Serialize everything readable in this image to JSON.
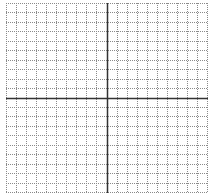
{
  "diagram": {
    "type": "coordinate-grid",
    "columns": 20,
    "rows": 20,
    "width_px": 202,
    "height_px": 190,
    "colors": {
      "minor_line": "#8a8a8a",
      "axis_line": "#333333",
      "background": "#ffffff"
    },
    "axis_x_index": 10,
    "axis_y_index": 10
  }
}
